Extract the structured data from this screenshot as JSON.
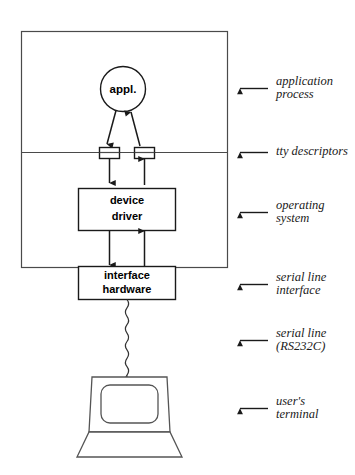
{
  "diagram": {
    "type": "block-diagram",
    "background_color": "#ffffff",
    "line_color": "#1a1a1a",
    "nodes": {
      "application": {
        "label": "appl.",
        "shape": "circle",
        "name": "application-process-node"
      },
      "descriptor_in": {
        "label": "",
        "shape": "rect",
        "name": "tty-descriptor-input"
      },
      "descriptor_out": {
        "label": "",
        "shape": "rect",
        "name": "tty-descriptor-output"
      },
      "device_driver": {
        "label_line1": "device",
        "label_line2": "driver",
        "shape": "rect",
        "name": "device-driver-box"
      },
      "interface_hardware": {
        "label_line1": "interface",
        "label_line2": "hardware",
        "shape": "rect",
        "name": "interface-hardware-box"
      },
      "terminal": {
        "label": "",
        "shape": "terminal-illustration",
        "name": "user-terminal-illustration"
      }
    },
    "regions": {
      "application_process": {
        "name": "application-process-region"
      },
      "operating_system": {
        "name": "operating-system-region"
      }
    },
    "annotations": [
      {
        "id": "application-process",
        "line1": "application",
        "line2": "process"
      },
      {
        "id": "tty-descriptors",
        "line1": "tty descriptors",
        "line2": ""
      },
      {
        "id": "operating-system",
        "line1": "operating",
        "line2": "system"
      },
      {
        "id": "serial-line-interface",
        "line1": "serial line",
        "line2": "interface"
      },
      {
        "id": "serial-line-rs232c",
        "line1": "serial line",
        "line2": "(RS232C)"
      },
      {
        "id": "users-terminal",
        "line1": "user's",
        "line2": "terminal"
      }
    ],
    "connector": {
      "serial_cable_style": "wavy",
      "name": "serial-cable"
    }
  }
}
